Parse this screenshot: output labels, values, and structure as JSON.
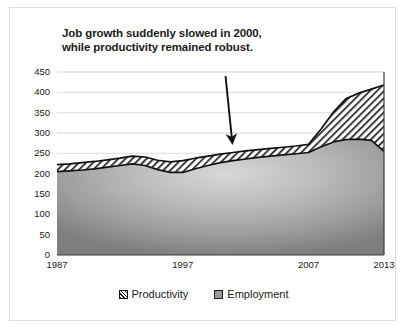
{
  "chart_data": {
    "type": "area",
    "stacked": true,
    "title": "Job growth suddenly slowed in 2000, while productivity remained robust.",
    "title_line1": "Job growth suddenly slowed in 2000,",
    "title_line2": "while productivity remained robust.",
    "xlabel": "",
    "ylabel": "",
    "xlim": [
      1987,
      2013
    ],
    "ylim": [
      0,
      450
    ],
    "yticks": [
      0,
      50,
      100,
      150,
      200,
      250,
      300,
      350,
      400,
      450
    ],
    "ytick_labels": [
      "0",
      "50",
      "100",
      "150",
      "200",
      "250",
      "300",
      "350",
      "400",
      "450"
    ],
    "xticks": [
      1987,
      1997,
      2007,
      2013
    ],
    "xtick_labels": [
      "1987",
      "1997",
      "2007",
      "2013"
    ],
    "grid": true,
    "legend_position": "bottom",
    "x": [
      1987,
      1988,
      1989,
      1990,
      1991,
      1992,
      1993,
      1994,
      1995,
      1996,
      1997,
      1998,
      1999,
      2000,
      2001,
      2002,
      2003,
      2004,
      2005,
      2006,
      2007,
      2008,
      2009,
      2010,
      2011,
      2012,
      2013
    ],
    "series": [
      {
        "name": "Employment",
        "color": "#9a9a9a",
        "values": [
          205,
          207,
          209,
          212,
          216,
          220,
          224,
          220,
          210,
          203,
          203,
          212,
          220,
          227,
          232,
          236,
          240,
          243,
          246,
          249,
          252,
          266,
          278,
          284,
          285,
          282,
          255
        ]
      },
      {
        "name": "Productivity",
        "color": "#ffffff",
        "pattern": "diagonal-hatch",
        "values": [
          222,
          224,
          227,
          230,
          234,
          238,
          243,
          241,
          233,
          229,
          232,
          238,
          243,
          248,
          252,
          256,
          259,
          262,
          265,
          268,
          272,
          310,
          352,
          385,
          398,
          408,
          418
        ],
        "note": "values are cumulative top-of-stack totals"
      }
    ],
    "annotation": {
      "text": "Job growth suddenly slowed in 2000, while productivity remained robust.",
      "arrow_from_year": 2000.4,
      "arrow_from_value": 440,
      "arrow_to_year": 2000.9,
      "arrow_to_value": 288
    }
  },
  "legend": {
    "items": [
      {
        "label": "Productivity",
        "swatch": "hatch"
      },
      {
        "label": "Employment",
        "swatch": "solid"
      }
    ]
  },
  "colors": {
    "grid": "#e2e2e2",
    "axis": "#1a1a1a",
    "text": "#1a1a1a",
    "border": "#dcdcdc",
    "employment_fill": "#9a9a9a",
    "productivity_fill": "#ffffff",
    "background": "#ffffff"
  }
}
